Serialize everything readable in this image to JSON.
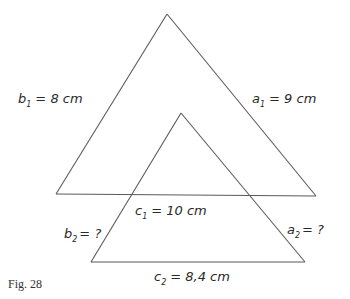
{
  "figure": {
    "caption": "Fig. 28",
    "triangles": [
      {
        "id": "triangle-1",
        "labels": {
          "a": {
            "var": "a",
            "sub": "1",
            "value": "= 9 cm"
          },
          "b": {
            "var": "b",
            "sub": "1",
            "value": "= 8 cm"
          },
          "c": {
            "var": "c",
            "sub": "1",
            "value": "= 10 cm"
          }
        }
      },
      {
        "id": "triangle-2",
        "labels": {
          "a": {
            "var": "a",
            "sub": "2",
            "value": "= ?"
          },
          "b": {
            "var": "b",
            "sub": "2",
            "value": "= ?"
          },
          "c": {
            "var": "c",
            "sub": "2",
            "value": "= 8,4 cm"
          }
        }
      }
    ]
  }
}
